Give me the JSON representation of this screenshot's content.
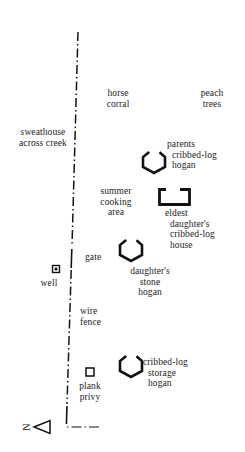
{
  "figure": {
    "type": "site-plan-map",
    "background_color": "#ffffff",
    "ink_color": "#141414"
  },
  "compass": {
    "direction_letter": "N",
    "orientation": "arrow points left (west-ish), letter rotated",
    "name": "north-arrow"
  },
  "fence": {
    "label_wire_fence": "wire\nfence",
    "label_gate": "gate",
    "style": "dash-dot line running top to bottom",
    "color": "#141414"
  },
  "labels": [
    {
      "id": "horse-corral",
      "text": "horse\ncorral",
      "align": "ctr",
      "x": 92,
      "y": 88,
      "w": 52
    },
    {
      "id": "peach-trees",
      "text": "peach\ntrees",
      "align": "ctr",
      "x": 186,
      "y": 88,
      "w": 52
    },
    {
      "id": "sweathouse",
      "text": "sweathouse\nacross creek",
      "align": "ctr",
      "x": 5,
      "y": 127,
      "w": 76
    },
    {
      "id": "parents-hogan",
      "text": "parents\n  cribbed-log\n  hogan",
      "align": "lft",
      "x": 167,
      "y": 139,
      "w": 76
    },
    {
      "id": "summer-cooking",
      "text": "summer\ncooking\narea",
      "align": "ctr",
      "x": 88,
      "y": 186,
      "w": 56
    },
    {
      "id": "eldest-daughter",
      "text": "eldest\n  daughter's\n  cribbed-log\n  house",
      "align": "lft",
      "x": 165,
      "y": 208,
      "w": 80
    },
    {
      "id": "gate",
      "text": "gate",
      "align": "lft",
      "x": 85,
      "y": 252,
      "w": 34
    },
    {
      "id": "daughters-stone",
      "text": "daughter's\nstone\nhogan",
      "align": "ctr",
      "x": 112,
      "y": 266,
      "w": 76
    },
    {
      "id": "well",
      "text": "well",
      "align": "ctr",
      "x": 32,
      "y": 278,
      "w": 34
    },
    {
      "id": "wire-fence",
      "text": "wire\nfence",
      "align": "lft",
      "x": 80,
      "y": 306,
      "w": 44
    },
    {
      "id": "storage-hogan",
      "text": "cribbed-log\n  storage\n  hogan",
      "align": "lft",
      "x": 143,
      "y": 357,
      "w": 74
    },
    {
      "id": "plank-privy",
      "text": "plank\nprivy",
      "align": "ctr",
      "x": 64,
      "y": 381,
      "w": 52
    }
  ],
  "symbols": [
    {
      "id": "parents-cribbed-log-hogan",
      "shape": "hexagon-with-door-gap",
      "cx": 154,
      "cy": 162,
      "r": 11
    },
    {
      "id": "eldest-daughter-house",
      "shape": "rectangle-with-door-gap",
      "x": 159,
      "y": 189,
      "w": 30,
      "h": 15
    },
    {
      "id": "daughters-stone-hogan",
      "shape": "hexagon-with-door-gap",
      "cx": 131,
      "cy": 250,
      "r": 11
    },
    {
      "id": "cribbed-log-storage-hogan",
      "shape": "hexagon-with-door-gap",
      "cx": 131,
      "cy": 366,
      "r": 11
    },
    {
      "id": "well-marker",
      "shape": "square-with-dot",
      "cx": 56,
      "cy": 269,
      "s": 7
    },
    {
      "id": "plank-privy-marker",
      "shape": "open-square",
      "cx": 90,
      "cy": 372,
      "s": 8
    }
  ]
}
